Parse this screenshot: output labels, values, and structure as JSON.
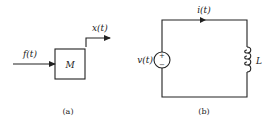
{
  "figure_a": {
    "input_label": "f(t)",
    "block_label": "M",
    "output_label": "x(t)",
    "caption": "(a)"
  },
  "figure_b": {
    "current_label": "i(t)",
    "source_label": "v(t)",
    "source_plus": "+",
    "source_minus": "−",
    "inductor_label": "L",
    "caption": "(b)"
  },
  "colors": {
    "stroke": "#222222",
    "background": "#ffffff"
  }
}
